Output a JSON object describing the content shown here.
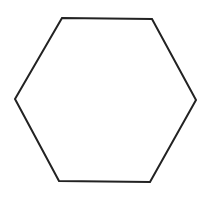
{
  "diagram": {
    "shape": "hexagon",
    "background": "#ffffff",
    "stroke_color": "#222222",
    "stroke_width": 2,
    "fill": "none",
    "vertices": [
      [
        62,
        18
      ],
      [
        152,
        19
      ],
      [
        196,
        100
      ],
      [
        150,
        182
      ],
      [
        59,
        181
      ],
      [
        15,
        99
      ]
    ]
  }
}
